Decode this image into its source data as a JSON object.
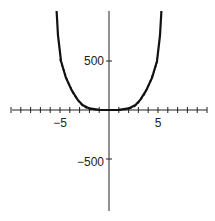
{
  "chart_data": {
    "type": "line",
    "title": "",
    "xlabel": "",
    "ylabel": "",
    "xlim": [
      -11,
      11
    ],
    "ylim": [
      -1000,
      1000
    ],
    "grid": false,
    "legend": null,
    "x_ticks": [
      -10,
      -9,
      -8,
      -7,
      -6,
      -5,
      -4,
      -3,
      -2,
      -1,
      1,
      2,
      3,
      4,
      5,
      6,
      7,
      8,
      9,
      10
    ],
    "x_tick_labels": [
      {
        "value": -5,
        "label": "-5"
      },
      {
        "value": 5,
        "label": "5"
      }
    ],
    "y_ticks": [
      500,
      -500
    ],
    "y_tick_labels": [
      {
        "value": 500,
        "label": "500"
      },
      {
        "value": -500,
        "label": "-500"
      }
    ],
    "series": [
      {
        "name": "solid curve",
        "style": "solid",
        "x": [
          -5.35,
          -5.2,
          -4.9,
          -4.4,
          -3.8,
          -3.2,
          -2.7,
          -2.0,
          -1.0,
          0,
          1.0,
          2.0,
          2.7,
          3.2,
          3.8,
          4.4,
          4.9,
          5.2,
          5.35
        ],
        "values": [
          1010,
          760,
          500,
          330,
          200,
          105,
          50,
          16,
          1,
          0,
          1,
          16,
          50,
          105,
          200,
          330,
          500,
          760,
          1010
        ]
      },
      {
        "name": "dashed curve",
        "style": "dashed",
        "x": [
          -5.0,
          -4.7,
          -4.2,
          -3.6,
          -3.0,
          -2.5,
          -2.0,
          -1.0,
          0,
          1.0,
          2.0,
          2.5,
          3.0,
          3.6,
          4.2,
          4.7,
          5.0
        ],
        "values": [
          520,
          430,
          290,
          160,
          75,
          30,
          10,
          0.5,
          0,
          0.5,
          10,
          30,
          75,
          160,
          290,
          430,
          520
        ]
      }
    ]
  },
  "labels": {
    "x_neg5": "−5",
    "x_pos5": "5",
    "y_pos500": "500",
    "y_neg500": "−500"
  }
}
